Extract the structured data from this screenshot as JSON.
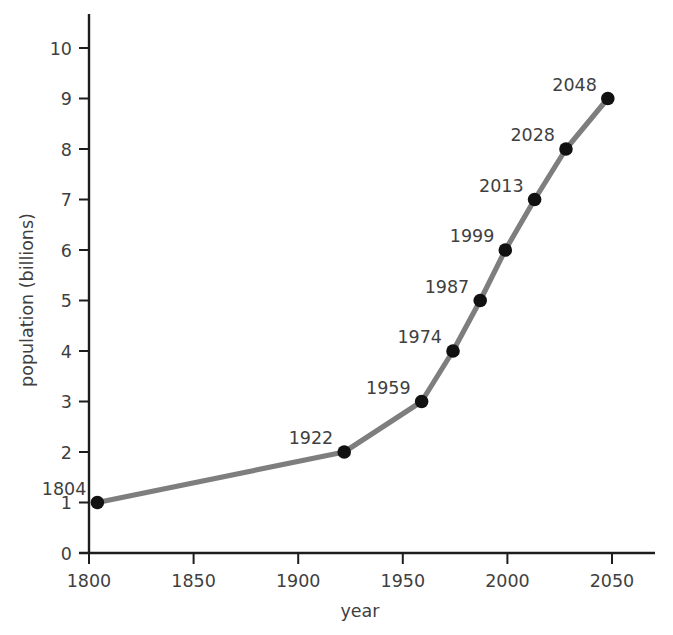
{
  "chart_data": {
    "type": "line",
    "title": "",
    "xlabel": "year",
    "ylabel": "population (billions)",
    "xlim": [
      1800,
      2050
    ],
    "ylim": [
      0,
      10
    ],
    "xticks": [
      "1800",
      "1850",
      "1900",
      "1950",
      "2000",
      "2050"
    ],
    "yticks": [
      "0",
      "1",
      "2",
      "3",
      "4",
      "5",
      "6",
      "7",
      "8",
      "9",
      "10"
    ],
    "grid": false,
    "legend": "none",
    "series": [
      {
        "name": "world population",
        "x": [
          1804,
          1922,
          1959,
          1974,
          1987,
          1999,
          2013,
          2028,
          2048
        ],
        "values": [
          1,
          2,
          3,
          4,
          5,
          6,
          7,
          8,
          9
        ],
        "point_labels": [
          "1804",
          "1922",
          "1959",
          "1974",
          "1987",
          "1999",
          "2013",
          "2028",
          "2048"
        ],
        "line_color": "#7e7e7e",
        "marker_color": "#111111"
      }
    ]
  },
  "axis_title_x": "year",
  "axis_title_y": "population (billions)"
}
